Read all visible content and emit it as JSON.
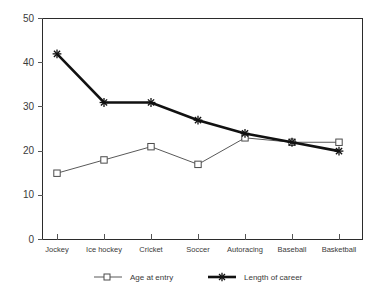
{
  "chart_data": {
    "type": "line",
    "title": "",
    "subtitle": "",
    "xlabel": "",
    "ylabel": "",
    "categories": [
      "Jockey",
      "Ice hockey",
      "Cricket",
      "Soccer",
      "Autoracing",
      "Baseball",
      "Basketball"
    ],
    "series": [
      {
        "name": "Age at entry",
        "marker": "square",
        "line_weight": "thin",
        "color": "#595959",
        "values": [
          15,
          18,
          21,
          17,
          23,
          22,
          22
        ]
      },
      {
        "name": "Length of career",
        "marker": "star",
        "line_weight": "thick",
        "color": "#111111",
        "values": [
          42,
          31,
          31,
          27,
          24,
          22,
          20
        ]
      }
    ],
    "ylim": [
      0,
      50
    ],
    "yticks": [
      0,
      10,
      20,
      30,
      40,
      50
    ],
    "ytick_labels": [
      "0",
      "10",
      "20",
      "30",
      "40",
      "50"
    ],
    "grid": false,
    "legend_position": "bottom"
  },
  "legend": {
    "entries": [
      {
        "label": "Age at entry",
        "marker": "square-marker-icon"
      },
      {
        "label": "Length of career",
        "marker": "star-marker-icon"
      }
    ]
  },
  "axes": {
    "y_tick_0": "0",
    "y_tick_1": "10",
    "y_tick_2": "20",
    "y_tick_3": "30",
    "y_tick_4": "40",
    "y_tick_5": "50",
    "x_tick_0": "Jockey",
    "x_tick_1": "Ice hockey",
    "x_tick_2": "Cricket",
    "x_tick_3": "Soccer",
    "x_tick_4": "Autoracing",
    "x_tick_5": "Baseball",
    "x_tick_6": "Basketball"
  }
}
